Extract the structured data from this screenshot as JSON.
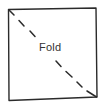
{
  "diagram": {
    "label": "Fold",
    "colors": {
      "stroke": "#2b2b2b",
      "text": "#333333",
      "background": "#ffffff"
    },
    "square": {
      "top_left": [
        8,
        9
      ],
      "top_right": [
        96,
        8
      ],
      "bottom_right": [
        97,
        97
      ],
      "bottom_left": [
        9,
        100
      ]
    },
    "fold_line": {
      "style": "dashed",
      "from": "top_left",
      "to": "bottom_right"
    }
  }
}
